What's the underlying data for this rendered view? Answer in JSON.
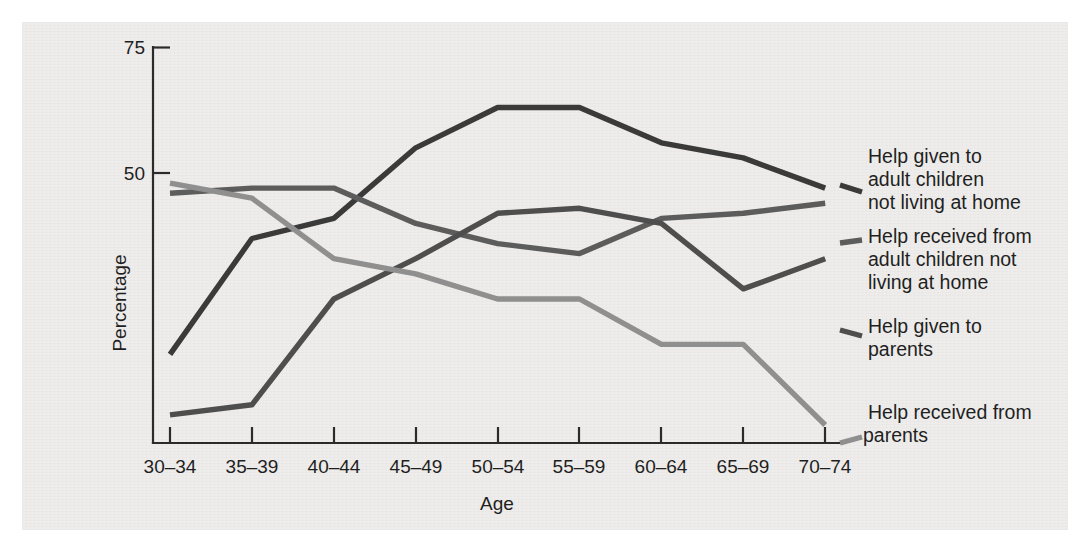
{
  "figure": {
    "background_color": "#eeedeb",
    "page_color": "#ffffff"
  },
  "axes": {
    "y_title": "Percentage",
    "x_title": "Age",
    "y_ticks": [
      "50",
      "75"
    ],
    "y_tick_values": [
      50,
      75
    ],
    "x_tick_labels": [
      "30–34",
      "35–39",
      "40–44",
      "45–49",
      "50–54",
      "55–59",
      "60–64",
      "65–69",
      "70–74"
    ]
  },
  "legend": {
    "position": "right",
    "entries": [
      {
        "name": "help-given-adult-children",
        "lines": [
          "Help given to",
          "adult children",
          "not living at home"
        ],
        "color": "#3a3a3a"
      },
      {
        "name": "help-received-adult-children",
        "lines": [
          "Help received from",
          "adult children not",
          "living at home"
        ],
        "color": "#5c5c5c"
      },
      {
        "name": "help-given-parents",
        "lines": [
          "Help given to",
          "parents"
        ],
        "color": "#4e4e4e"
      },
      {
        "name": "help-received-parents",
        "lines": [
          "Help received from",
          "parents"
        ],
        "color": "#8f8f8f"
      }
    ]
  },
  "chart_data": {
    "type": "line",
    "title": "",
    "xlabel": "Age",
    "ylabel": "Percentage",
    "categories": [
      "30–34",
      "35–39",
      "40–44",
      "45–49",
      "50–54",
      "55–59",
      "60–64",
      "65–69",
      "70–74"
    ],
    "ylim": [
      0,
      75
    ],
    "yticks": [
      50,
      75
    ],
    "grid": false,
    "legend_position": "right",
    "series": [
      {
        "name": "Help given to adult children not living at home",
        "color": "#3a3a3a",
        "values": [
          14,
          37,
          41,
          55,
          63,
          63,
          56,
          53,
          47
        ]
      },
      {
        "name": "Help received from adult children not living at home",
        "color": "#5c5c5c",
        "values": [
          46,
          47,
          47,
          40,
          36,
          34,
          41,
          42,
          44
        ]
      },
      {
        "name": "Help given to parents",
        "color": "#4e4e4e",
        "values": [
          2,
          4,
          25,
          33,
          42,
          43,
          40,
          27,
          33
        ]
      },
      {
        "name": "Help received from parents",
        "color": "#8f8f8f",
        "values": [
          48,
          45,
          33,
          30,
          25,
          25,
          16,
          16,
          0
        ]
      }
    ]
  }
}
